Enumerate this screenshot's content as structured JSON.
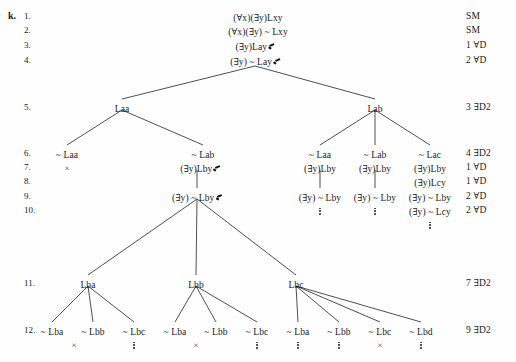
{
  "exercise": {
    "label": "k."
  },
  "line_numbers": [
    "1.",
    "2.",
    "3.",
    "4.",
    "5.",
    "6.",
    "7.",
    "8.",
    "9.",
    "10.",
    "11.",
    "12."
  ],
  "justifications": [
    {
      "line": 1,
      "text": "SM"
    },
    {
      "line": 2,
      "text": "SM"
    },
    {
      "line": 3,
      "text": "1 ∀D"
    },
    {
      "line": 4,
      "text": "2 ∀D"
    },
    {
      "line": 5,
      "text": "3 ∃D2"
    },
    {
      "line": 6,
      "text": "4 ∃D2"
    },
    {
      "line": 7,
      "text": "1 ∀D"
    },
    {
      "line": 8,
      "text": "1 ∀D"
    },
    {
      "line": 9,
      "text": "2 ∀D"
    },
    {
      "line": 10,
      "text": "2 ∀D"
    },
    {
      "line": 11,
      "text": "7 ∃D2"
    },
    {
      "line": 12,
      "text": "9 ∃D2"
    }
  ],
  "nodes": [
    {
      "id": "n1",
      "line": 1,
      "text": "(∀x)(∃y)Lxy",
      "checked": false,
      "x": 258,
      "y": 14
    },
    {
      "id": "n2",
      "line": 2,
      "text": "(∀x)(∃y) ~ Lxy",
      "checked": false,
      "x": 258,
      "y": 28
    },
    {
      "id": "n3",
      "line": 3,
      "text": "(∃y)Lay",
      "checked": true,
      "x": 255,
      "y": 43
    },
    {
      "id": "n4",
      "line": 4,
      "text": "(∃y) ~ Lay",
      "checked": true,
      "x": 255,
      "y": 58
    },
    {
      "id": "n5a",
      "line": 5,
      "text": "Laa",
      "checked": false,
      "x": 122,
      "y": 105
    },
    {
      "id": "n5b",
      "line": 5,
      "text": "Lab",
      "checked": false,
      "x": 375,
      "y": 105
    },
    {
      "id": "n6a",
      "line": 6,
      "text": "~ Laa",
      "checked": false,
      "x": 67,
      "y": 151
    },
    {
      "id": "n6b",
      "line": 6,
      "text": "~ Lab",
      "checked": false,
      "x": 203,
      "y": 151
    },
    {
      "id": "n6c",
      "line": 6,
      "text": "~ Laa",
      "checked": false,
      "x": 320,
      "y": 151
    },
    {
      "id": "n6d",
      "line": 6,
      "text": "~ Lab",
      "checked": false,
      "x": 375,
      "y": 151
    },
    {
      "id": "n6e",
      "line": 6,
      "text": "~ Lac",
      "checked": false,
      "x": 430,
      "y": 151
    },
    {
      "id": "n7b",
      "line": 7,
      "text": "(∃y)Lby",
      "checked": true,
      "x": 200,
      "y": 165
    },
    {
      "id": "n7c",
      "line": 7,
      "text": "(∃y)Lby",
      "checked": false,
      "x": 320,
      "y": 165
    },
    {
      "id": "n7d",
      "line": 7,
      "text": "(∃y)Lby",
      "checked": false,
      "x": 375,
      "y": 165
    },
    {
      "id": "n7e",
      "line": 7,
      "text": "(∃y)Lby",
      "checked": false,
      "x": 430,
      "y": 165
    },
    {
      "id": "n8e",
      "line": 8,
      "text": "(∃y)Lcy",
      "checked": false,
      "x": 430,
      "y": 179
    },
    {
      "id": "n9b",
      "line": 9,
      "text": "(∃y) ~ Lby",
      "checked": true,
      "x": 197,
      "y": 194
    },
    {
      "id": "n9c",
      "line": 9,
      "text": "(∃y) ~ Lby",
      "checked": false,
      "x": 320,
      "y": 194
    },
    {
      "id": "n9d",
      "line": 9,
      "text": "(∃y) ~ Lby",
      "checked": false,
      "x": 375,
      "y": 194
    },
    {
      "id": "n9e",
      "line": 9,
      "text": "(∃y) ~ Lby",
      "checked": false,
      "x": 430,
      "y": 194
    },
    {
      "id": "n10e",
      "line": 10,
      "text": "(∃y) ~ Lcy",
      "checked": false,
      "x": 430,
      "y": 208
    },
    {
      "id": "n11a",
      "line": 11,
      "text": "Lba",
      "checked": false,
      "x": 88,
      "y": 281
    },
    {
      "id": "n11b",
      "line": 11,
      "text": "Lbb",
      "checked": false,
      "x": 196,
      "y": 281
    },
    {
      "id": "n11c",
      "line": 11,
      "text": "Lbc",
      "checked": false,
      "x": 296,
      "y": 281
    },
    {
      "id": "n12a",
      "line": 12,
      "text": "~ Lba",
      "checked": false,
      "x": 52,
      "y": 328
    },
    {
      "id": "n12b",
      "line": 12,
      "text": "~ Lbb",
      "checked": false,
      "x": 93,
      "y": 328
    },
    {
      "id": "n12c",
      "line": 12,
      "text": "~ Lbc",
      "checked": false,
      "x": 134,
      "y": 328
    },
    {
      "id": "n12d",
      "line": 12,
      "text": "~ Lba",
      "checked": false,
      "x": 175,
      "y": 328
    },
    {
      "id": "n12e",
      "line": 12,
      "text": "~ Lbb",
      "checked": false,
      "x": 216,
      "y": 328
    },
    {
      "id": "n12f",
      "line": 12,
      "text": "~ Lbc",
      "checked": false,
      "x": 257,
      "y": 328
    },
    {
      "id": "n12g",
      "line": 12,
      "text": "~ Lba",
      "checked": false,
      "x": 298,
      "y": 328
    },
    {
      "id": "n12h",
      "line": 12,
      "text": "~ Lbb",
      "checked": false,
      "x": 339,
      "y": 328
    },
    {
      "id": "n12i",
      "line": 12,
      "text": "~ Lbc",
      "checked": false,
      "x": 380,
      "y": 328
    },
    {
      "id": "n12j",
      "line": 12,
      "text": "~ Lbd",
      "checked": false,
      "x": 421,
      "y": 328
    }
  ],
  "closure_marks": [
    {
      "for": "n6a",
      "symbol": "×",
      "x": 67,
      "y": 164
    },
    {
      "for": "n12a",
      "symbol": "×",
      "x": 74,
      "y": 341
    },
    {
      "for": "n12e",
      "symbol": "×",
      "x": 196,
      "y": 341
    },
    {
      "for": "n12i",
      "symbol": "×",
      "x": 380,
      "y": 341
    }
  ],
  "open_marks": [
    {
      "for": "n9c",
      "x": 320,
      "y": 206
    },
    {
      "for": "n9d",
      "x": 375,
      "y": 206
    },
    {
      "for": "n10e",
      "x": 430,
      "y": 220
    },
    {
      "for": "n12c",
      "x": 134,
      "y": 340
    },
    {
      "for": "n12f",
      "x": 257,
      "y": 340
    },
    {
      "for": "n12g",
      "x": 298,
      "y": 340
    },
    {
      "for": "n12h",
      "x": 339,
      "y": 340
    },
    {
      "for": "n12j",
      "x": 421,
      "y": 340
    }
  ],
  "edges": [
    {
      "from": "n4",
      "to": "n5a",
      "x1": 255,
      "y1": 66,
      "x2": 122,
      "y2": 99
    },
    {
      "from": "n4",
      "to": "n5b",
      "x1": 255,
      "y1": 66,
      "x2": 375,
      "y2": 99
    },
    {
      "from": "n5a",
      "to": "n6a",
      "x1": 122,
      "y1": 110,
      "x2": 67,
      "y2": 145
    },
    {
      "from": "n5a",
      "to": "n6b",
      "x1": 122,
      "y1": 110,
      "x2": 203,
      "y2": 145
    },
    {
      "from": "n5b",
      "to": "n6c",
      "x1": 375,
      "y1": 110,
      "x2": 320,
      "y2": 145
    },
    {
      "from": "n5b",
      "to": "n6d",
      "x1": 375,
      "y1": 110,
      "x2": 375,
      "y2": 145
    },
    {
      "from": "n5b",
      "to": "n6e",
      "x1": 375,
      "y1": 110,
      "x2": 430,
      "y2": 145
    },
    {
      "from": "n7b",
      "to": "n9b",
      "x1": 197,
      "y1": 170,
      "x2": 197,
      "y2": 188
    },
    {
      "from": "n7c",
      "to": "n9c",
      "x1": 320,
      "y1": 170,
      "x2": 320,
      "y2": 188
    },
    {
      "from": "n7d",
      "to": "n9d",
      "x1": 375,
      "y1": 170,
      "x2": 375,
      "y2": 188
    },
    {
      "from": "n9b",
      "to": "n11a",
      "x1": 197,
      "y1": 199,
      "x2": 88,
      "y2": 275
    },
    {
      "from": "n9b",
      "to": "n11b",
      "x1": 197,
      "y1": 199,
      "x2": 196,
      "y2": 275
    },
    {
      "from": "n9b",
      "to": "n11c",
      "x1": 197,
      "y1": 199,
      "x2": 296,
      "y2": 275
    },
    {
      "from": "n11a",
      "to": "n12a",
      "x1": 88,
      "y1": 286,
      "x2": 52,
      "y2": 322
    },
    {
      "from": "n11a",
      "to": "n12b",
      "x1": 88,
      "y1": 286,
      "x2": 93,
      "y2": 322
    },
    {
      "from": "n11a",
      "to": "n12c",
      "x1": 88,
      "y1": 286,
      "x2": 134,
      "y2": 322
    },
    {
      "from": "n11b",
      "to": "n12d",
      "x1": 196,
      "y1": 286,
      "x2": 175,
      "y2": 322
    },
    {
      "from": "n11b",
      "to": "n12e",
      "x1": 196,
      "y1": 286,
      "x2": 216,
      "y2": 322
    },
    {
      "from": "n11b",
      "to": "n12f",
      "x1": 196,
      "y1": 286,
      "x2": 257,
      "y2": 322
    },
    {
      "from": "n11c",
      "to": "n12g",
      "x1": 296,
      "y1": 286,
      "x2": 298,
      "y2": 322
    },
    {
      "from": "n11c",
      "to": "n12h",
      "x1": 296,
      "y1": 286,
      "x2": 339,
      "y2": 322
    },
    {
      "from": "n11c",
      "to": "n12i",
      "x1": 296,
      "y1": 286,
      "x2": 380,
      "y2": 322
    },
    {
      "from": "n11c",
      "to": "n12j",
      "x1": 296,
      "y1": 286,
      "x2": 421,
      "y2": 322
    }
  ],
  "line_number_positions": [
    {
      "n": 0,
      "y": 12
    },
    {
      "n": 1,
      "y": 26
    },
    {
      "n": 2,
      "y": 41
    },
    {
      "n": 3,
      "y": 56
    },
    {
      "n": 4,
      "y": 103
    },
    {
      "n": 5,
      "y": 149
    },
    {
      "n": 6,
      "y": 163
    },
    {
      "n": 7,
      "y": 177
    },
    {
      "n": 8,
      "y": 192
    },
    {
      "n": 9,
      "y": 206
    },
    {
      "n": 10,
      "y": 279
    },
    {
      "n": 11,
      "y": 326
    }
  ],
  "justification_x": 466,
  "linenum_x": 24,
  "label_x": 8,
  "label_y": 11
}
